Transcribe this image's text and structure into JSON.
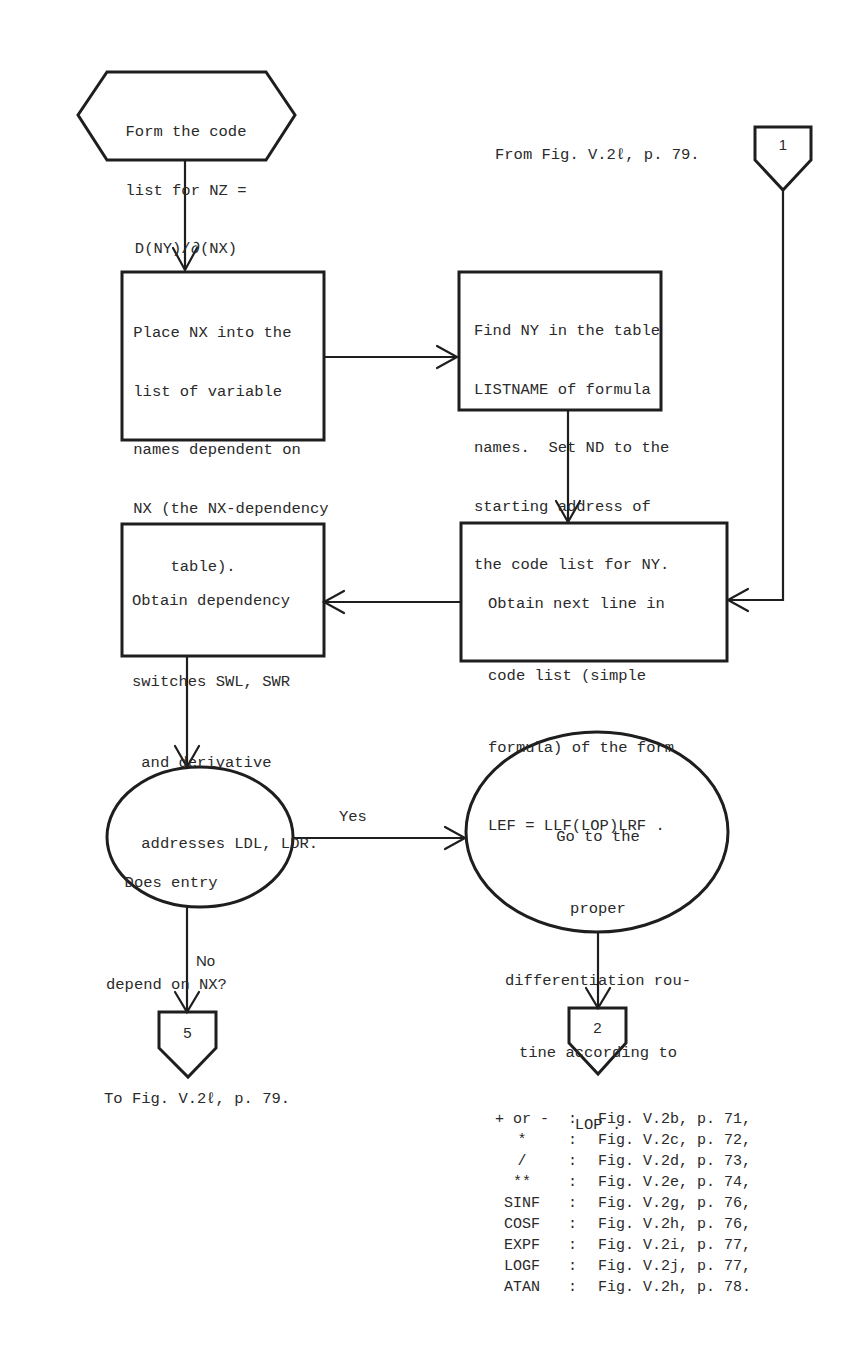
{
  "diagram": {
    "start": {
      "lines": [
        "Form the code",
        "list for NZ =",
        "D(NY)/∂(NX)"
      ]
    },
    "place_nx": {
      "lines": [
        " Place NX into the",
        " list of variable",
        " names dependent on",
        " NX (the NX-dependency",
        "     table)."
      ]
    },
    "find_ny": {
      "lines": [
        "Find NY in the table",
        "LISTNAME of formula",
        "names.  Set ND to the",
        "starting address of",
        "the code list for NY."
      ]
    },
    "obtain_dep": {
      "lines": [
        "Obtain dependency",
        "switches SWL, SWR",
        " and derivative",
        " addresses LDL, LDR."
      ]
    },
    "obtain_next": {
      "lines": [
        "Obtain next line in",
        "code list (simple",
        "formula) of the form",
        "LEF = LLF(LOP)LRF ."
      ]
    },
    "decision": {
      "lines": [
        "  Does entry",
        "depend on NX?"
      ]
    },
    "go_to": {
      "lines": [
        "Go to the",
        "proper",
        "differentiation rou-",
        "tine according to",
        "LOP ."
      ]
    },
    "edges": {
      "yes_label": "Yes",
      "no_label": "No"
    },
    "connectors": {
      "in_1": {
        "number": "1",
        "note": "From Fig. V.2ℓ, p. 79."
      },
      "out_5": {
        "number": "5",
        "note": "To Fig. V.2ℓ, p. 79."
      },
      "out_2": {
        "number": "2"
      }
    },
    "routine_table": [
      {
        "op": "+ or -",
        "ref": "Fig. V.2b, p. 71,"
      },
      {
        "op": "*",
        "ref": "Fig. V.2c, p. 72,"
      },
      {
        "op": "/",
        "ref": "Fig. V.2d, p. 73,"
      },
      {
        "op": "**",
        "ref": "Fig. V.2e, p. 74,"
      },
      {
        "op": "SINF",
        "ref": "Fig. V.2g, p. 76,"
      },
      {
        "op": "COSF",
        "ref": "Fig. V.2h, p. 76,"
      },
      {
        "op": "EXPF",
        "ref": "Fig. V.2i, p. 77,"
      },
      {
        "op": "LOGF",
        "ref": "Fig. V.2j, p. 77,"
      },
      {
        "op": "ATAN",
        "ref": "Fig. V.2h, p. 78."
      }
    ],
    "colors": {
      "stroke": "#1e1e1e",
      "text": "#2a2a2a",
      "background": "#ffffff"
    }
  }
}
